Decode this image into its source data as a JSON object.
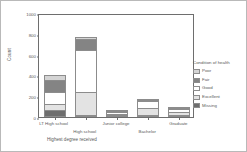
{
  "chart_data": {
    "type": "bar",
    "subtype": "stacked-vertical",
    "title": "",
    "xlabel": "Highest degree received",
    "ylabel": "Count",
    "categories": [
      "LT High school",
      "High school",
      "Junior college",
      "Bachelor",
      "Graduate"
    ],
    "ylim": [
      0,
      1000
    ],
    "yticks": [
      0,
      200,
      400,
      600,
      800,
      1000
    ],
    "ytick_labels": [
      "0",
      "200",
      "400",
      "600",
      "800",
      "1000"
    ],
    "grid": false,
    "legend_position": "right",
    "legend_title": "Condition of health",
    "stack_order_bottom_to_top": [
      "Missing",
      "Excellent",
      "Good",
      "Fair",
      "Poor"
    ],
    "series": [
      {
        "name": "Poor",
        "color": "#d4d4d4",
        "values": [
          45,
          18,
          3,
          5,
          3
        ]
      },
      {
        "name": "Fair",
        "color": "#848484",
        "values": [
          120,
          105,
          8,
          12,
          8
        ]
      },
      {
        "name": "Good",
        "color": "#ffffff",
        "values": [
          110,
          405,
          18,
          62,
          30
        ]
      },
      {
        "name": "Excellent",
        "color": "#e3e3e3",
        "values": [
          65,
          220,
          12,
          72,
          25
        ]
      },
      {
        "name": "Missing",
        "color": "#6e6e6e",
        "values": [
          65,
          15,
          4,
          7,
          5
        ]
      }
    ],
    "totals": [
      405,
      763,
      45,
      158,
      71
    ]
  },
  "axes": {
    "ylabel": "Count",
    "xlabel": "Highest degree received"
  },
  "legend": {
    "title": "Condition of health",
    "items": [
      {
        "label": "Poor",
        "color": "#d4d4d4"
      },
      {
        "label": "Fair",
        "color": "#848484"
      },
      {
        "label": "Good",
        "color": "#ffffff"
      },
      {
        "label": "Excellent",
        "color": "#e3e3e3"
      },
      {
        "label": "Missing",
        "color": "#6e6e6e"
      }
    ]
  }
}
